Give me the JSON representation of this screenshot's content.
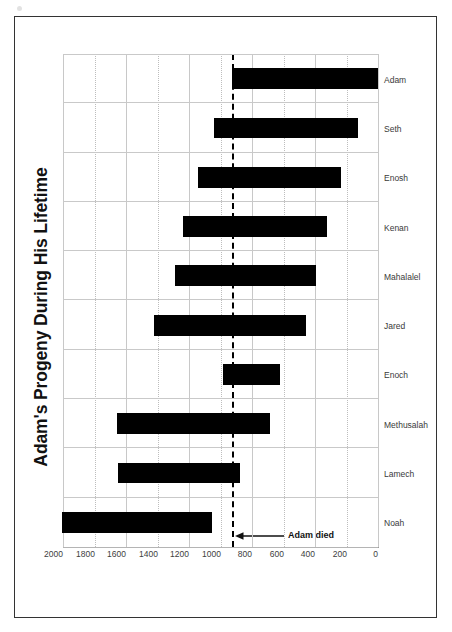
{
  "figure": {
    "title": "Adam's Progeny During His Lifetime",
    "frame_color": "#333333",
    "background": "#ffffff",
    "rotation_degrees": -90
  },
  "annotation": {
    "label": "Adam died",
    "value": 930,
    "line_style": "dashed",
    "line_color": "#000000",
    "arrow": "up-arrow-icon"
  },
  "axis": {
    "value_axis_title": "Year",
    "ticks": [
      0,
      200,
      400,
      600,
      800,
      1000,
      1200,
      1400,
      1600,
      1800,
      2000
    ],
    "tick_labels": [
      "0",
      "200",
      "400",
      "600",
      "800",
      "1000",
      "1200",
      "1400",
      "1600",
      "1800",
      "2000"
    ],
    "min": 0,
    "max": 2000,
    "grid": true
  },
  "chart_data": {
    "type": "bar",
    "orientation": "floating-range-bars",
    "title": "Adam's Progeny During His Lifetime",
    "xlabel": "",
    "ylabel": "Year",
    "ylim": [
      0,
      2000
    ],
    "grid": true,
    "legend": "none",
    "bar_color": "#000000",
    "categories": [
      "Noah",
      "Lamech",
      "Methusalah",
      "Enoch",
      "Jared",
      "Mahalalel",
      "Kenan",
      "Enosh",
      "Seth",
      "Adam"
    ],
    "series": [
      {
        "name": "Birth year",
        "values": [
          1056,
          874,
          687,
          622,
          460,
          395,
          325,
          235,
          130,
          0
        ]
      },
      {
        "name": "Death year",
        "values": [
          2006,
          1651,
          1656,
          987,
          1422,
          1290,
          1235,
          1140,
          1042,
          930
        ]
      }
    ],
    "bars": [
      {
        "label": "Noah",
        "start": 1056,
        "end": 2006,
        "span": 950
      },
      {
        "label": "Lamech",
        "start": 874,
        "end": 1651,
        "span": 777
      },
      {
        "label": "Methusalah",
        "start": 687,
        "end": 1656,
        "span": 969
      },
      {
        "label": "Enoch",
        "start": 622,
        "end": 987,
        "span": 365
      },
      {
        "label": "Jared",
        "start": 460,
        "end": 1422,
        "span": 962
      },
      {
        "label": "Mahalalel",
        "start": 395,
        "end": 1290,
        "span": 895
      },
      {
        "label": "Kenan",
        "start": 325,
        "end": 1235,
        "span": 910
      },
      {
        "label": "Enosh",
        "start": 235,
        "end": 1140,
        "span": 905
      },
      {
        "label": "Seth",
        "start": 130,
        "end": 1042,
        "span": 912
      },
      {
        "label": "Adam",
        "start": 0,
        "end": 930,
        "span": 930
      }
    ],
    "annotations": [
      {
        "text": "Adam died",
        "value": 930,
        "type": "reference-line"
      }
    ]
  }
}
